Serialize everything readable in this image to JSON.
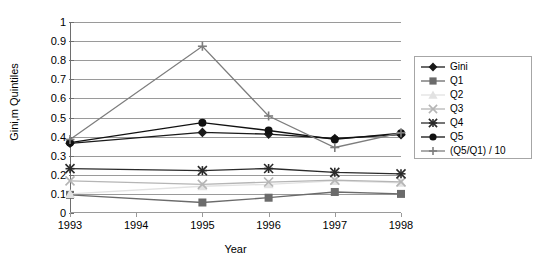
{
  "chart_data": {
    "type": "line",
    "title": "",
    "xlabel": "Year",
    "ylabel": "Gini,m Quintiles",
    "x": [
      1993,
      1994,
      1995,
      1996,
      1997,
      1998
    ],
    "xticklabels": [
      "1993",
      "1994",
      "1995",
      "1996",
      "1997",
      "1998"
    ],
    "yticklabels": [
      "0",
      "0.1",
      "0.2",
      "0.3",
      "0.4",
      "0.5",
      "0.6",
      "0.7",
      "0.8",
      "0.9",
      "1"
    ],
    "ylim": [
      0,
      1
    ],
    "ytick_step": 0.1,
    "grid": "horizontal",
    "legend_position": "right",
    "series": [
      {
        "name": "Gini",
        "color": "#1a1a1a",
        "marker": "diamond",
        "values": [
          0.365,
          null,
          0.422,
          0.413,
          0.39,
          0.41
        ]
      },
      {
        "name": "Q1",
        "color": "#6b6b6b",
        "marker": "square",
        "values": [
          0.095,
          null,
          0.055,
          0.08,
          0.11,
          0.1
        ]
      },
      {
        "name": "Q2",
        "color": "#e2e2e2",
        "marker": "triangle",
        "values": [
          0.1,
          null,
          0.14,
          0.15,
          0.168,
          0.158
        ]
      },
      {
        "name": "Q3",
        "color": "#b5b5b5",
        "marker": "x",
        "values": [
          0.168,
          null,
          0.15,
          0.162,
          0.172,
          0.163
        ]
      },
      {
        "name": "Q4",
        "color": "#2a2a2a",
        "marker": "star",
        "values": [
          0.232,
          null,
          0.222,
          0.233,
          0.213,
          0.205
        ]
      },
      {
        "name": "Q5",
        "color": "#111111",
        "marker": "circle",
        "values": [
          0.368,
          null,
          0.473,
          0.432,
          0.385,
          0.418
        ]
      },
      {
        "name": "(Q5/Q1) / 10",
        "color": "#7d7d7d",
        "marker": "plus",
        "values": [
          0.385,
          null,
          0.873,
          0.508,
          0.343,
          0.42
        ]
      }
    ]
  },
  "axes": {
    "y_title": "Gini,m Quintiles",
    "x_title": "Year",
    "y_ticks": [
      "1",
      "0.9",
      "0.8",
      "0.7",
      "0.6",
      "0.5",
      "0.4",
      "0.3",
      "0.2",
      "0.1",
      "0"
    ],
    "x_ticks": [
      "1993",
      "1994",
      "1995",
      "1996",
      "1997",
      "1998"
    ]
  },
  "legend": {
    "items": [
      {
        "label": "Gini",
        "color": "#1a1a1a",
        "marker": "diamond"
      },
      {
        "label": "Q1",
        "color": "#6b6b6b",
        "marker": "square"
      },
      {
        "label": "Q2",
        "color": "#e2e2e2",
        "marker": "triangle"
      },
      {
        "label": "Q3",
        "color": "#b5b5b5",
        "marker": "x"
      },
      {
        "label": "Q4",
        "color": "#2a2a2a",
        "marker": "star"
      },
      {
        "label": "Q5",
        "color": "#111111",
        "marker": "circle"
      },
      {
        "label": "(Q5/Q1) / 10",
        "color": "#7d7d7d",
        "marker": "plus"
      }
    ]
  },
  "colors": {
    "gridline": "#9a9a9a",
    "axis": "#6e6e6e",
    "background": "#ffffff",
    "text": "#000000",
    "legend_border": "#a6a6a6"
  }
}
